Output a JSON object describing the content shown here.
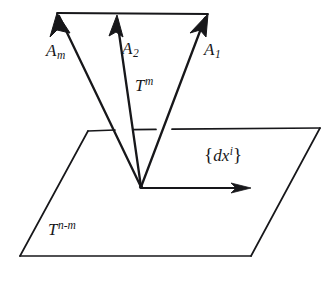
{
  "figure": {
    "background_color": "#ffffff",
    "ink_color": "#17171a",
    "labels": {
      "vector_m": {
        "base": "A",
        "sub": "m"
      },
      "vector_2": {
        "base": "A",
        "sub": "2"
      },
      "vector_1": {
        "base": "A",
        "sub": "1"
      },
      "subspace_tangent": {
        "base": "T",
        "sup": "m"
      },
      "covector_basis": {
        "open": "{",
        "base": "d",
        "var": "x",
        "sup": "i",
        "close": "}"
      },
      "subspace_normal": {
        "base": "T",
        "sup": "n-m"
      }
    },
    "geometry": {
      "apex": {
        "x": 141,
        "y": 187
      },
      "arrow_tips": {
        "vector_m": {
          "x": 57,
          "y": 13
        },
        "vector_2": {
          "x": 117,
          "y": 15
        },
        "vector_1": {
          "x": 208,
          "y": 14
        }
      },
      "top_connector": {
        "x1": 57,
        "y1": 13,
        "x2": 208,
        "y2": 14
      },
      "plane_corners": {
        "top_left": {
          "x": 88,
          "y": 131
        },
        "top_right": {
          "x": 320,
          "y": 128
        },
        "bottom_right": {
          "x": 251,
          "y": 256
        },
        "bottom_left": {
          "x": 20,
          "y": 256
        }
      },
      "in_plane_arrow": {
        "x1": 141,
        "y1": 188,
        "x2": 251,
        "y2": 188
      }
    }
  }
}
